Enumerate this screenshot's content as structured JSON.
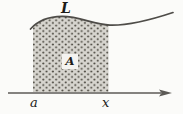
{
  "figure": {
    "labels": {
      "curve": "L",
      "area": "A",
      "lower_bound": "a",
      "upper_bound": "x"
    },
    "colors": {
      "background": "#fbfbf9",
      "region_fill": "#d7d5cf",
      "stipple_dot": "#49463e",
      "curve_stroke": "#4e4c48",
      "axis_stroke": "#5c5a56",
      "area_box_fill": "#f4f3f0",
      "text": "#1d1b18"
    }
  }
}
